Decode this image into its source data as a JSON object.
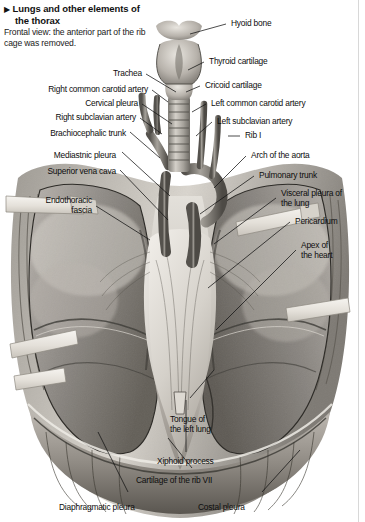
{
  "figure": {
    "marker": "▶",
    "title": "Lungs and other elements of the thorax",
    "caption": "Frontal view: the anterior part of the rib cage was removed.",
    "view": "Frontal view",
    "subject": "thorax"
  },
  "labels": [
    {
      "id": "hyoid-bone",
      "text": "Hyoid bone",
      "side": "right"
    },
    {
      "id": "thyroid-cartilage",
      "text": "Thyroid cartilage",
      "side": "right"
    },
    {
      "id": "cricoid-cartilage",
      "text": "Cricoid cartilage",
      "side": "right"
    },
    {
      "id": "left-common-carotid",
      "text": "Left common carotid artery",
      "side": "right"
    },
    {
      "id": "left-subclavian-artery",
      "text": "Left subclavian artery",
      "side": "right"
    },
    {
      "id": "rib-i",
      "text": "Rib I",
      "side": "right"
    },
    {
      "id": "arch-of-the-aorta",
      "text": "Arch of the aorta",
      "side": "right"
    },
    {
      "id": "pulmonary-trunk",
      "text": "Pulmonary trunk",
      "side": "right"
    },
    {
      "id": "visceral-pleura",
      "text": "Visceral pleura of\nthe lung",
      "side": "right"
    },
    {
      "id": "pericardium",
      "text": "Pericardium",
      "side": "right"
    },
    {
      "id": "apex-of-the-heart",
      "text": "Apex of\nthe heart",
      "side": "right"
    },
    {
      "id": "trachea",
      "text": "Trachea",
      "side": "left"
    },
    {
      "id": "right-common-carotid",
      "text": "Right common carotid artery",
      "side": "left"
    },
    {
      "id": "cervical-pleura",
      "text": "Cervical pleura",
      "side": "left"
    },
    {
      "id": "right-subclavian-artery",
      "text": "Right subclavian artery",
      "side": "left"
    },
    {
      "id": "brachiocephalic-trunk",
      "text": "Brachiocephalic trunk",
      "side": "left"
    },
    {
      "id": "mediastnic-pleura",
      "text": "Mediastnic pleura",
      "side": "left"
    },
    {
      "id": "superior-vena-cava",
      "text": "Superior vena cava",
      "side": "left"
    },
    {
      "id": "endothoracic-fascia",
      "text": "Endothoracic\nfascia",
      "side": "left"
    },
    {
      "id": "tongue-of-the-left-lung",
      "text": "Tongue of\nthe left lung",
      "side": "bottom"
    },
    {
      "id": "xiphoid-process",
      "text": "Xiphoid process",
      "side": "bottom"
    },
    {
      "id": "cartilage-of-the-rib-vii",
      "text": "Cartilage of the rib VII",
      "side": "bottom"
    },
    {
      "id": "diaphragmatic-pleura",
      "text": "Diaphragmatic pleura",
      "side": "bottom"
    },
    {
      "id": "costal-pleura",
      "text": "Costal pleura",
      "side": "bottom"
    }
  ],
  "colors": {
    "background": "#ffffff",
    "text": "#0d0d0d",
    "leader": "#111111",
    "border": "#d8d8d8",
    "tissue_dark": "#4a4a4a",
    "tissue_mid": "#8d8a86",
    "tissue_light": "#c9c5c0",
    "flap": "#e9e6e0"
  }
}
